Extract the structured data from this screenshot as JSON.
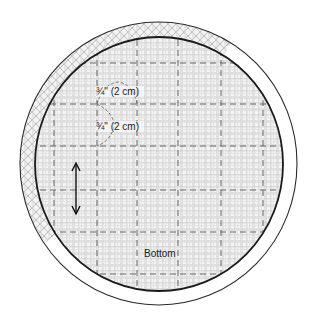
{
  "diagram": {
    "type": "sewing-pattern-piece",
    "piece_name": "Bottom",
    "measurements": [
      {
        "label": "3/4\" (2 cm)",
        "display": "³/₄\" (2 cm)",
        "direction": "horizontal"
      },
      {
        "label": "3/4\" (2 cm)",
        "display": "³/₄\" (2 cm)",
        "direction": "vertical"
      }
    ],
    "grainline": {
      "symbol": "double-arrow",
      "orientation": "vertical"
    },
    "colors": {
      "outline": "#1a1a1a",
      "grid_dash": "#555555",
      "plaid_light": "#e6e6e6",
      "plaid_dark": "#cfcfcf",
      "background": "#ffffff"
    },
    "labels": {
      "top_measure": "¾\" (2 cm)",
      "side_measure": "¾\" (2 cm)",
      "piece": "Bottom"
    }
  }
}
